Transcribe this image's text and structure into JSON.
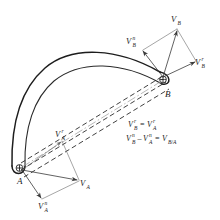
{
  "figure": {
    "background_color": "#ffffff",
    "ink_color": "#1d1d1a"
  },
  "points": [
    {
      "id": "A",
      "label": "A",
      "x": 18,
      "y": 172
    },
    {
      "id": "B",
      "label": "B",
      "x": 167,
      "y": 88
    }
  ],
  "vectors": [
    {
      "id": "vb",
      "label": "V",
      "subscript": "B",
      "superscript": "",
      "label_x": 172,
      "label_y": 22,
      "from": {
        "x": 161,
        "y": 78
      },
      "to": {
        "x": 178,
        "y": 29
      }
    },
    {
      "id": "vb_n",
      "label": "V",
      "subscript": "B",
      "superscript": "n",
      "label_x": 128,
      "label_y": 45,
      "from": {
        "x": 161,
        "y": 78
      },
      "to": {
        "x": 142,
        "y": 50
      }
    },
    {
      "id": "vb_r",
      "label": "V",
      "subscript": "B",
      "superscript": "r",
      "label_x": 196,
      "label_y": 65,
      "from": {
        "x": 161,
        "y": 78
      },
      "to": {
        "x": 197,
        "y": 61
      }
    },
    {
      "id": "va",
      "label": "V",
      "subscript": "A",
      "superscript": "",
      "label_x": 80,
      "label_y": 186,
      "from": {
        "x": 22,
        "y": 169
      },
      "to": {
        "x": 79,
        "y": 181
      }
    },
    {
      "id": "va_n",
      "label": "V",
      "subscript": "A",
      "superscript": "n",
      "label_x": 41,
      "label_y": 207,
      "from": {
        "x": 22,
        "y": 169
      },
      "to": {
        "x": 42,
        "y": 199
      }
    },
    {
      "id": "va_r",
      "label": "V",
      "subscript": "A",
      "superscript": "r",
      "label_x": 58,
      "label_y": 135,
      "from": {
        "x": 22,
        "y": 169
      },
      "to": {
        "x": 62,
        "y": 141
      }
    }
  ],
  "equations": [
    {
      "id": "eq1",
      "text": "Vᴮʳ = Vᴬʳ",
      "x": 128,
      "y": 127
    },
    {
      "id": "eq2",
      "text": "Vᴮⁿ − Vᴬⁿ = Vᴮ∕ᴬ",
      "x": 128,
      "y": 141
    }
  ],
  "equation_parts": {
    "line1": {
      "v1": "V",
      "v1_sub": "B",
      "v1_sup": "r",
      "operator": "=",
      "v2": "V",
      "v2_sub": "A",
      "v2_sup": "r"
    },
    "line2": {
      "v1": "V",
      "v1_sub": "B",
      "v1_sup": "n",
      "operator1": "–",
      "v2": "V",
      "v2_sub": "A",
      "v2_sup": "n",
      "operator2": "=",
      "v3": "V",
      "v3_sub": "B/A",
      "v3_sup": ""
    }
  },
  "link": {
    "name": "curved-link-AB",
    "description": "curved banana-shaped rigid link with rounded ends at A and B"
  },
  "construction_lines": {
    "dashed_count": 3,
    "centerline": true
  }
}
